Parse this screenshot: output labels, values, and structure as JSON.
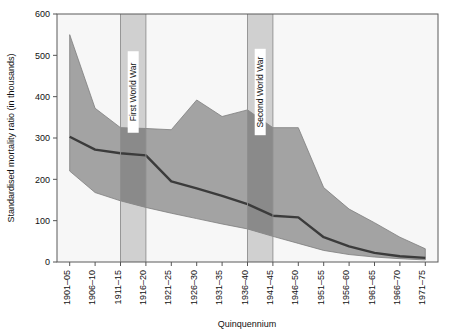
{
  "chart_data": {
    "type": "area",
    "title": "",
    "xlabel": "Quinquennium",
    "ylabel": "Standardised mortality ratio (in thousands)",
    "ylim": [
      0,
      600
    ],
    "ytick_step": 100,
    "yticks": [
      "0",
      "100",
      "200",
      "300",
      "400",
      "500",
      "600"
    ],
    "grid": false,
    "legend_position": "none",
    "categories": [
      "1901–05",
      "1906–10",
      "1911–15",
      "1916–20",
      "1921–25",
      "1926–30",
      "1931–35",
      "1936–40",
      "1941–45",
      "1946–50",
      "1951–55",
      "1956–60",
      "1961–65",
      "1966–70",
      "1971–75"
    ],
    "series": [
      {
        "name": "Upper bound",
        "role": "band-upper",
        "values": [
          550,
          372,
          325,
          323,
          320,
          392,
          352,
          368,
          325,
          325,
          180,
          128,
          95,
          60,
          32
        ]
      },
      {
        "name": "Median",
        "role": "median-line",
        "values": [
          303,
          272,
          263,
          258,
          195,
          178,
          160,
          140,
          112,
          108,
          60,
          38,
          22,
          14,
          10
        ]
      },
      {
        "name": "Lower bound",
        "role": "band-lower",
        "values": [
          220,
          168,
          148,
          132,
          118,
          105,
          92,
          80,
          62,
          45,
          28,
          18,
          12,
          8,
          5
        ]
      }
    ],
    "annotations": [
      {
        "label": "First World War",
        "from_category": "1911–15",
        "to_category": "1916–20",
        "orientation": "vertical"
      },
      {
        "label": "Second World War",
        "from_category": "1936–40",
        "to_category": "1941–45",
        "orientation": "vertical"
      }
    ],
    "colors": {
      "band_fill": "#a3a3a3",
      "band_fill_dark": "#8a8a8a",
      "median_line": "#3b3b3b",
      "war_band": "#d0d0d0",
      "war_label_box": "#ffffff",
      "axis": "#555555",
      "plot_background": "#f7f7f7",
      "text": "#111111"
    }
  }
}
